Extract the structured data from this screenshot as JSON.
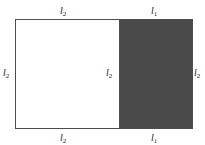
{
  "figure": {
    "type": "geometry-diagram",
    "background_color": "#ffffff",
    "stroke_color": "#4d4d4d",
    "shaded_fill_color": "#4a4a4a",
    "unshaded_fill_color": "#ffffff"
  },
  "symbols": {
    "l1": {
      "letter": "l",
      "subscript": "1"
    },
    "l2": {
      "letter": "l",
      "subscript": "2"
    }
  },
  "labels": [
    {
      "id": "top-left",
      "letter": "l",
      "subscript": "2",
      "position": "top",
      "segment": "left"
    },
    {
      "id": "top-right",
      "letter": "l",
      "subscript": "1",
      "position": "top",
      "segment": "right"
    },
    {
      "id": "left-edge",
      "letter": "l",
      "subscript": "2",
      "position": "left",
      "segment": "full"
    },
    {
      "id": "middle-edge",
      "letter": "l",
      "subscript": "2",
      "position": "middle",
      "segment": "divider"
    },
    {
      "id": "right-edge",
      "letter": "l",
      "subscript": "2",
      "position": "right",
      "segment": "full"
    },
    {
      "id": "bottom-left",
      "letter": "l",
      "subscript": "2",
      "position": "bottom",
      "segment": "left"
    },
    {
      "id": "bottom-right",
      "letter": "l",
      "subscript": "1",
      "position": "bottom",
      "segment": "right"
    }
  ]
}
